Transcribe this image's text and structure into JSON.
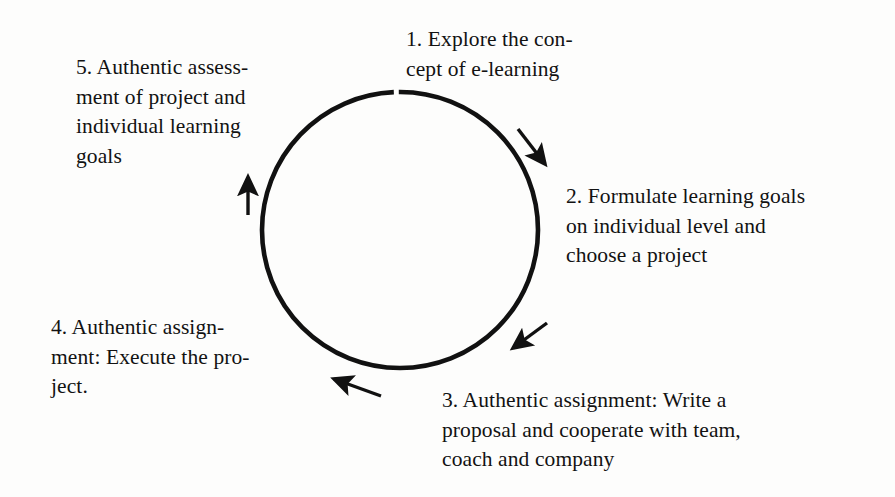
{
  "diagram": {
    "type": "cycle-diagram",
    "background_color": "#fdfdfc",
    "stroke_color": "#111111",
    "circle": {
      "center_x": 400,
      "center_y": 230,
      "radius": 138,
      "stroke_width": 4.5
    },
    "steps": [
      {
        "number": "1",
        "id": "step-1",
        "position": "top",
        "text": "1. Explore the con-\ncept of e-learning"
      },
      {
        "number": "2",
        "id": "step-2",
        "position": "right",
        "text": "2. Formulate learning goals\non individual level and\nchoose a project"
      },
      {
        "number": "3",
        "id": "step-3",
        "position": "bottom-right",
        "text": "3. Authentic assignment: Write a\nproposal and cooperate with team,\ncoach and company"
      },
      {
        "number": "4",
        "id": "step-4",
        "position": "bottom-left",
        "text": "4. Authentic assign-\nment: Execute the pro-\nject."
      },
      {
        "number": "5",
        "id": "step-5",
        "position": "top-left",
        "text": "5. Authentic assess-\nment of project and\nindividual learning\ngoals"
      }
    ],
    "arrows": [
      {
        "id": "arrow-1-to-2",
        "name": "arrow-upper-right",
        "direction": "down-right",
        "from_x": 518,
        "from_y": 129,
        "to_x": 549,
        "to_y": 169
      },
      {
        "id": "arrow-2-to-3",
        "name": "arrow-lower-right",
        "direction": "down-left",
        "from_x": 547,
        "from_y": 323,
        "to_x": 508,
        "to_y": 352
      },
      {
        "id": "arrow-3-to-4",
        "name": "arrow-bottom",
        "direction": "up-left",
        "from_x": 381,
        "from_y": 396,
        "to_x": 329,
        "to_y": 377
      },
      {
        "id": "arrow-4-to-5",
        "name": "arrow-left",
        "direction": "up",
        "from_x": 248,
        "from_y": 215,
        "to_x": 248,
        "to_y": 171
      }
    ]
  }
}
